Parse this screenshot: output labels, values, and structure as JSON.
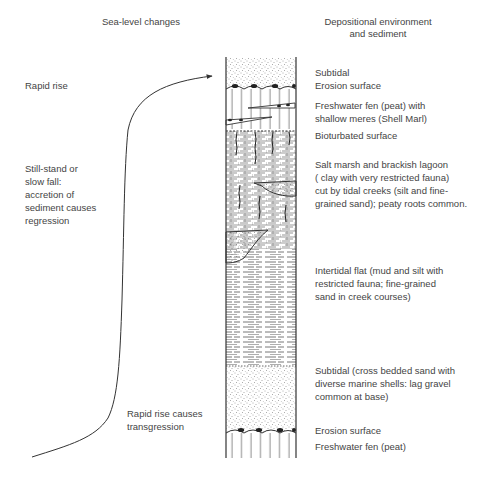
{
  "headers": {
    "left": "Sea-level changes",
    "right": "Depositional environment\nand sediment"
  },
  "sea_level_labels": [
    {
      "id": "rapid-rise",
      "text": "Rapid rise"
    },
    {
      "id": "still-stand",
      "text": "Still-stand or\nslow fall:\naccretion of\nsediment causes\nregression"
    },
    {
      "id": "rapid-rise-transgression",
      "text": "Rapid rise causes\ntransgression"
    }
  ],
  "environment_labels": [
    {
      "id": "subtidal-top",
      "text": "Subtidal"
    },
    {
      "id": "erosion-surface-top",
      "text": "Erosion surface"
    },
    {
      "id": "freshwater-fen-shell-marl",
      "text": "Freshwater fen (peat) with\nshallow meres (Shell Marl)"
    },
    {
      "id": "bioturbated-surface",
      "text": "Bioturbated surface"
    },
    {
      "id": "salt-marsh",
      "text": "Salt marsh and brackish lagoon\n( clay with very restricted fauna)\ncut by tidal creeks (silt and fine-\ngrained sand); peaty roots common."
    },
    {
      "id": "intertidal-flat",
      "text": "Intertidal flat (mud and silt with\nrestricted fauna; fine-grained\nsand in creek courses)"
    },
    {
      "id": "subtidal-bottom",
      "text": "Subtidal (cross bedded sand with\ndiverse marine shells: lag gravel\ncommon at base)"
    },
    {
      "id": "erosion-surface-bottom",
      "text": "Erosion surface"
    },
    {
      "id": "freshwater-fen-bottom",
      "text": "Freshwater fen (peat)"
    }
  ],
  "column_layers_top_to_bottom": [
    {
      "name": "subtidal-sand",
      "pattern": "stipple"
    },
    {
      "name": "erosion-surface",
      "pattern": "wavy-line-with-pebbles"
    },
    {
      "name": "freshwater-peat-with-shell-marl",
      "pattern": "vertical-lines-with-lenses"
    },
    {
      "name": "bioturbated-surface",
      "pattern": "burrowed-contact"
    },
    {
      "name": "salt-marsh-clay",
      "pattern": "brick-dashes-with-roots-and-sand-channels"
    },
    {
      "name": "intertidal-mud-silt",
      "pattern": "horizontal-dashes"
    },
    {
      "name": "subtidal-cross-bedded-sand",
      "pattern": "stipple"
    },
    {
      "name": "erosion-surface",
      "pattern": "wavy-line-with-pebbles"
    },
    {
      "name": "freshwater-peat",
      "pattern": "vertical-lines"
    }
  ],
  "colors": {
    "ink": "#333333",
    "text": "#444444",
    "background": "#ffffff"
  }
}
